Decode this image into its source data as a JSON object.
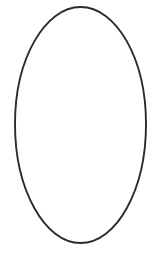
{
  "canvas": {
    "width": 161,
    "height": 268,
    "background_color": "#ffffff",
    "description": "Blank white canvas containing a single drawn shape"
  },
  "shapes": [
    {
      "name": "ellipse-outline",
      "type": "ellipse",
      "style": "hand-drawn outline",
      "center_x": 80.5,
      "center_y": 125,
      "radius_x": 65.5,
      "radius_y": 118,
      "bounds": {
        "left": 15,
        "top": 7,
        "right": 146,
        "bottom": 243
      },
      "stroke_color": "#2b2b2b",
      "stroke_width": 1.9,
      "fill": "none",
      "path": "M 80.5 7 C 116.5 7 146 59 146 124 C 146 190 116.5 243 80.5 243 C 45 243 15 190 15 124 C 15 59 45 7 80.5 7 Z"
    }
  ],
  "text_elements": [],
  "ui_controls": []
}
